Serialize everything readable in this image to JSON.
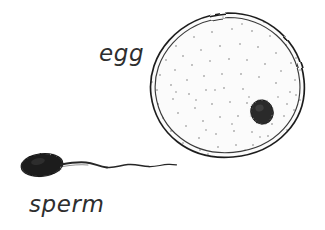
{
  "figure": {
    "background_color": "#ffffff",
    "ink_color": "#1f1f1f",
    "width": 325,
    "height": 230
  },
  "labels": {
    "egg": "egg",
    "sperm": "sperm"
  },
  "egg": {
    "name": "egg cell",
    "center_x": 228,
    "center_y": 85,
    "radius_x": 77,
    "radius_y": 73,
    "membrane_style": "double outline",
    "membrane_color": "#222222",
    "cytoplasm_color": "#fbfbfb",
    "stipple_color": "#b9b9b9",
    "stipple_count": 96,
    "nucleus": {
      "name": "nucleus",
      "center_x": 262,
      "center_y": 112,
      "radius_x": 11,
      "radius_y": 12,
      "color": "#2a2a2a"
    }
  },
  "sperm": {
    "name": "sperm cell",
    "head": {
      "center_x": 42,
      "center_y": 165,
      "radius_x": 21,
      "radius_y": 11,
      "rotation_deg": -6,
      "color": "#1c1c1c"
    },
    "tail": {
      "start_x": 62,
      "end_x": 176,
      "baseline_y": 166,
      "wave_count": 4,
      "color": "#252525"
    }
  }
}
